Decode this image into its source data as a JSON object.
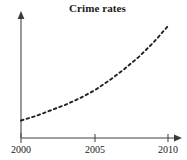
{
  "chart_data": {
    "type": "line",
    "title": "Crime rates",
    "xlabel": "",
    "ylabel": "",
    "xlim": [
      2000,
      2010
    ],
    "ylim": [
      0,
      100
    ],
    "grid": false,
    "legend": null,
    "line_style": "dashed",
    "line_color": "#222222",
    "axis_color": "#808080",
    "x_ticks": [
      "2000",
      "2005",
      "2010"
    ],
    "x_tick_values": [
      2000,
      2005,
      2010
    ],
    "y_ticks": [],
    "x": [
      2000,
      2001,
      2002,
      2003,
      2004,
      2005,
      2006,
      2007,
      2008,
      2009,
      2010
    ],
    "values": [
      15,
      19,
      24,
      29,
      35,
      42,
      51,
      61,
      72,
      85,
      100
    ],
    "series": [
      {
        "name": "Crime rates",
        "values": [
          15,
          19,
          24,
          29,
          35,
          42,
          51,
          61,
          72,
          85,
          100
        ]
      }
    ],
    "annotations": []
  },
  "axes": {
    "x_axis_name": "x-axis",
    "y_axis_name": "y-axis",
    "x_arrow": true,
    "y_arrow": true
  },
  "labels": {
    "tick_0": "2000",
    "tick_1": "2005",
    "tick_2": "2010"
  }
}
